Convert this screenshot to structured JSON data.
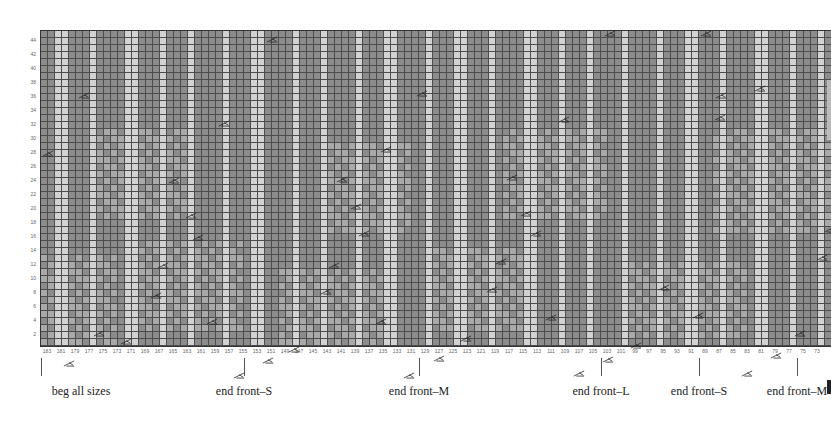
{
  "colors": {
    "dark": "#8c8c8c",
    "medium": "#a9a9a9",
    "light": "#d2d2d2",
    "gridline": "#4c4c4c",
    "marker": "#222222"
  },
  "grid": {
    "columns": 113,
    "rows": 45,
    "cell_width": 7,
    "cell_height": 7,
    "light_columns": [
      2,
      3,
      7,
      12,
      13,
      17,
      21,
      26,
      30,
      31,
      36,
      40,
      45,
      49,
      50,
      55,
      59,
      60,
      64,
      69,
      70,
      74,
      78,
      83,
      88,
      92,
      93,
      97,
      102,
      103,
      107,
      111
    ],
    "medium_cells_note": "band shading",
    "medium_bands": [
      {
        "col_start": 0,
        "col_end": 10,
        "row_start": 0,
        "row_end": 12
      },
      {
        "col_start": 14,
        "col_end": 28,
        "row_start": 2,
        "row_end": 14
      },
      {
        "col_start": 34,
        "col_end": 48,
        "row_start": 0,
        "row_end": 10
      },
      {
        "col_start": 55,
        "col_end": 70,
        "row_start": 2,
        "row_end": 13
      },
      {
        "col_start": 84,
        "col_end": 100,
        "row_start": 1,
        "row_end": 11
      },
      {
        "col_start": 8,
        "col_end": 20,
        "row_start": 18,
        "row_end": 30
      },
      {
        "col_start": 40,
        "col_end": 52,
        "row_start": 16,
        "row_end": 28
      },
      {
        "col_start": 66,
        "col_end": 80,
        "row_start": 18,
        "row_end": 30
      },
      {
        "col_start": 96,
        "col_end": 112,
        "row_start": 16,
        "row_end": 30
      }
    ]
  },
  "row_labels": [
    "2",
    "4",
    "6",
    "8",
    "10",
    "12",
    "14",
    "16",
    "18",
    "20",
    "22",
    "24",
    "26",
    "28",
    "30",
    "32",
    "34",
    "36",
    "38",
    "40",
    "42",
    "44"
  ],
  "column_labels": [
    "183",
    "181",
    "179",
    "177",
    "175",
    "173",
    "171",
    "169",
    "167",
    "165",
    "163",
    "161",
    "159",
    "157",
    "155",
    "153",
    "151",
    "149",
    "147",
    "145",
    "143",
    "141",
    "139",
    "137",
    "135",
    "133",
    "131",
    "129",
    "127",
    "125",
    "123",
    "121",
    "119",
    "117",
    "115",
    "113",
    "111",
    "109",
    "107",
    "105",
    "103",
    "101",
    "99",
    "97",
    "95",
    "93",
    "91",
    "89",
    "87",
    "85",
    "83",
    "81",
    "79",
    "77",
    "75",
    "73"
  ],
  "markers": [
    {
      "x": 2,
      "y": 120
    },
    {
      "x": 38,
      "y": 62
    },
    {
      "x": 23,
      "y": 330
    },
    {
      "x": 53,
      "y": 300
    },
    {
      "x": 80,
      "y": 308
    },
    {
      "x": 110,
      "y": 262
    },
    {
      "x": 117,
      "y": 232
    },
    {
      "x": 128,
      "y": 147
    },
    {
      "x": 145,
      "y": 182
    },
    {
      "x": 152,
      "y": 204
    },
    {
      "x": 166,
      "y": 288
    },
    {
      "x": 178,
      "y": 90
    },
    {
      "x": 193,
      "y": 342
    },
    {
      "x": 222,
      "y": 327
    },
    {
      "x": 226,
      "y": 6
    },
    {
      "x": 248,
      "y": 316
    },
    {
      "x": 280,
      "y": 258
    },
    {
      "x": 288,
      "y": 232
    },
    {
      "x": 296,
      "y": 146
    },
    {
      "x": 310,
      "y": 173
    },
    {
      "x": 318,
      "y": 200
    },
    {
      "x": 335,
      "y": 288
    },
    {
      "x": 340,
      "y": 116
    },
    {
      "x": 363,
      "y": 342
    },
    {
      "x": 376,
      "y": 60
    },
    {
      "x": 393,
      "y": 325
    },
    {
      "x": 420,
      "y": 305
    },
    {
      "x": 446,
      "y": 256
    },
    {
      "x": 455,
      "y": 228
    },
    {
      "x": 466,
      "y": 144
    },
    {
      "x": 480,
      "y": 180
    },
    {
      "x": 490,
      "y": 200
    },
    {
      "x": 505,
      "y": 284
    },
    {
      "x": 518,
      "y": 86
    },
    {
      "x": 533,
      "y": 340
    },
    {
      "x": 562,
      "y": 326
    },
    {
      "x": 564,
      "y": 0
    },
    {
      "x": 590,
      "y": 312
    },
    {
      "x": 618,
      "y": 254
    },
    {
      "x": 652,
      "y": 282
    },
    {
      "x": 674,
      "y": 84
    },
    {
      "x": 675,
      "y": 62
    },
    {
      "x": 701,
      "y": 340
    },
    {
      "x": 714,
      "y": 55
    },
    {
      "x": 730,
      "y": 322
    },
    {
      "x": 754,
      "y": 300
    },
    {
      "x": 784,
      "y": 196
    },
    {
      "x": 776,
      "y": 224
    },
    {
      "x": 660,
      "y": -6
    }
  ],
  "annotations": [
    {
      "label": "beg all sizes",
      "x": 41
    },
    {
      "label": "end front–S",
      "x": 244
    },
    {
      "label": "end front–M",
      "x": 419
    },
    {
      "label": "end front–L",
      "x": 601
    },
    {
      "label": "end front–S",
      "x": 699
    },
    {
      "label": "end front–M",
      "x": 797
    }
  ]
}
